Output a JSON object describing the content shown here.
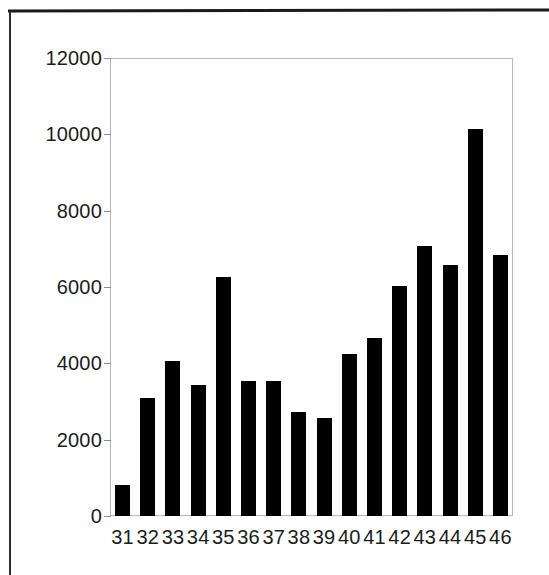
{
  "chart_data": {
    "type": "bar",
    "title": "",
    "subtitle": "",
    "xlabel": "",
    "ylabel": "",
    "categories": [
      "31",
      "32",
      "33",
      "34",
      "35",
      "36",
      "37",
      "38",
      "39",
      "40",
      "41",
      "42",
      "43",
      "44",
      "45",
      "46"
    ],
    "values": [
      810,
      3090,
      4060,
      3430,
      6260,
      3540,
      3540,
      2720,
      2570,
      4250,
      4660,
      6030,
      7070,
      6570,
      10140,
      6840
    ],
    "series": [
      {
        "name": "",
        "values": [
          810,
          3090,
          4060,
          3430,
          6260,
          3540,
          3540,
          2720,
          2570,
          4250,
          4660,
          6030,
          7070,
          6570,
          10140,
          6840
        ]
      }
    ],
    "ylim": [
      0,
      12000
    ],
    "ytick_labels": [
      "0",
      "2000",
      "4000",
      "6000",
      "8000",
      "10000",
      "12000"
    ],
    "ytick_values": [
      0,
      2000,
      4000,
      6000,
      8000,
      10000,
      12000
    ],
    "xtick_labels": [
      "31",
      "32",
      "33",
      "34",
      "35",
      "36",
      "37",
      "38",
      "39",
      "40",
      "41",
      "42",
      "43",
      "44",
      "45",
      "46"
    ],
    "grid": false,
    "legend": false,
    "legend_position": "none",
    "bar_color": "#000000",
    "plot_border_color": "#b9b9b9",
    "background_color": "#ffffff",
    "text_color": "#1c1c1c"
  },
  "page": {
    "scan_rule_color": "#1a1a1a"
  }
}
